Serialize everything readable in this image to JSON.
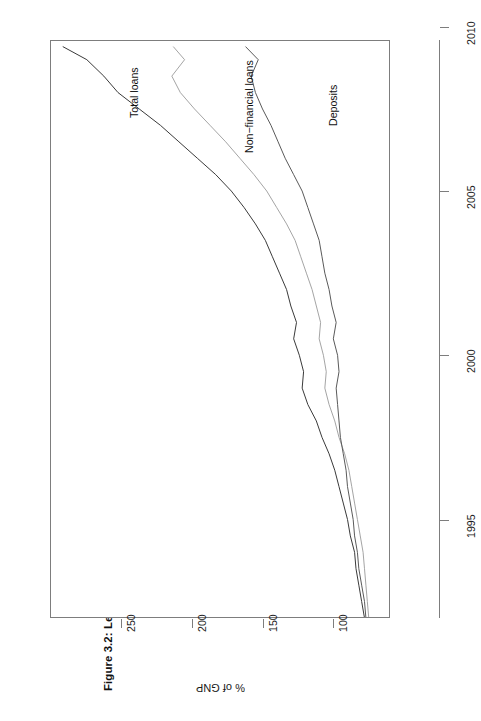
{
  "figure": {
    "title": "Figure 3.2: Lending to the Private Sector and Deposits of Irish Banks as a Percentage of GNP, 1992–2009",
    "orientation": "rotated-90-ccw"
  },
  "axes": {
    "y_axis_title": "% of GNP",
    "y_ticks": [
      "100",
      "150",
      "200",
      "250"
    ],
    "x_ticks": [
      "1995",
      "2000",
      "2005",
      "2010"
    ]
  },
  "series_labels": {
    "total_loans": "Total loans",
    "non_financial_loans": "Non−financial loans",
    "deposits": "Deposits"
  },
  "colors": {
    "total_loans": "#3a3a3a",
    "non_financial_loans": "#9a9a9a",
    "deposits": "#5a5a5a",
    "frame": "#7d7d7d",
    "grid": "#e8e8e8",
    "text": "#1a1a1a"
  },
  "chart_data": {
    "type": "line",
    "title": "Figure 3.2: Lending to the Private Sector and Deposits of Irish Banks as a Percentage of GNP, 1992–2009",
    "xlabel": "",
    "ylabel": "% of GNP",
    "xlim": [
      1992.0,
      2009.6
    ],
    "ylim": [
      60,
      300
    ],
    "xticks": [
      1995,
      2000,
      2005,
      2010
    ],
    "yticks": [
      100,
      150,
      200,
      250
    ],
    "grid": false,
    "legend": "inline-series-labels",
    "x": [
      1992.0,
      1992.5,
      1993.0,
      1993.5,
      1994.0,
      1994.5,
      1995.0,
      1995.5,
      1996.0,
      1996.5,
      1997.0,
      1997.5,
      1998.0,
      1998.5,
      1999.0,
      1999.5,
      2000.0,
      2000.5,
      2001.0,
      2001.5,
      2002.0,
      2002.5,
      2003.0,
      2003.5,
      2004.0,
      2004.5,
      2005.0,
      2005.5,
      2006.0,
      2006.5,
      2007.0,
      2007.5,
      2008.0,
      2008.5,
      2009.0,
      2009.4
    ],
    "series": [
      {
        "name": "Total loans",
        "color": "#3a3a3a",
        "values": [
          78,
          80,
          82,
          84,
          85,
          88,
          90,
          93,
          96,
          99,
          103,
          108,
          112,
          118,
          122,
          121,
          124,
          128,
          126,
          130,
          133,
          138,
          143,
          148,
          155,
          163,
          172,
          183,
          196,
          209,
          222,
          237,
          252,
          262,
          274,
          291
        ]
      },
      {
        "name": "Non−financial loans",
        "color": "#9a9a9a",
        "values": [
          75,
          76,
          77,
          78,
          79,
          81,
          83,
          85,
          87,
          89,
          92,
          96,
          99,
          103,
          106,
          105,
          107,
          110,
          109,
          112,
          115,
          119,
          123,
          127,
          133,
          140,
          147,
          156,
          166,
          176,
          187,
          198,
          208,
          214,
          205,
          213
        ]
      },
      {
        "name": "Deposits",
        "color": "#5a5a5a",
        "values": [
          77,
          78,
          80,
          82,
          83,
          85,
          86,
          88,
          90,
          91,
          93,
          95,
          96,
          97,
          98,
          96,
          97,
          100,
          98,
          101,
          103,
          106,
          108,
          110,
          114,
          118,
          122,
          128,
          134,
          139,
          144,
          150,
          155,
          158,
          153,
          162
        ]
      }
    ]
  }
}
